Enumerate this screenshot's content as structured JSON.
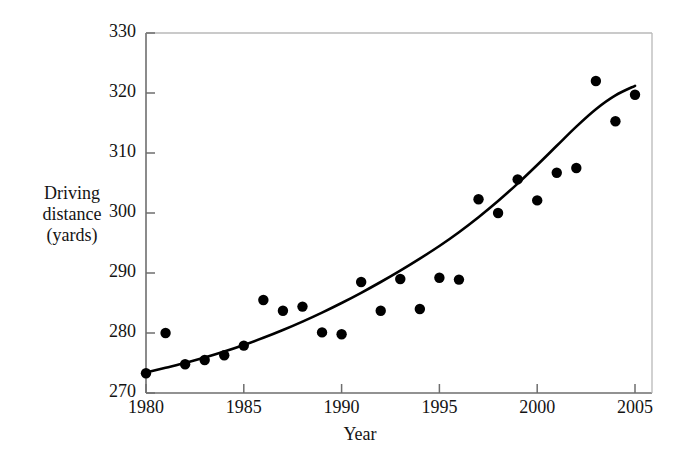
{
  "chart_data": {
    "type": "scatter",
    "title": "",
    "xlabel": "Year",
    "ylabel": "Driving distance (yards)",
    "ylabel_lines": [
      "Driving",
      "distance",
      "(yards)"
    ],
    "xlim": [
      1980,
      2005
    ],
    "ylim": [
      270,
      330
    ],
    "xticks": [
      1980,
      1985,
      1990,
      1995,
      2000,
      2005
    ],
    "xtick_labels": [
      "1980",
      "1985",
      "1990",
      "1995",
      "2000",
      "2005"
    ],
    "yticks": [
      270,
      280,
      290,
      300,
      310,
      320,
      330
    ],
    "ytick_labels": [
      "270",
      "280",
      "290",
      "300",
      "310",
      "320",
      "330"
    ],
    "grid": false,
    "legend": null,
    "marker": "filled-circle",
    "marker_color": "#000000",
    "line_color": "#000000",
    "x": [
      1980,
      1981,
      1982,
      1983,
      1984,
      1985,
      1986,
      1987,
      1988,
      1989,
      1990,
      1991,
      1992,
      1993,
      1994,
      1995,
      1996,
      1997,
      1998,
      1999,
      2000,
      2001,
      2002,
      2003,
      2004,
      2005
    ],
    "values": [
      273.3,
      280.0,
      274.8,
      275.5,
      276.3,
      277.9,
      285.5,
      283.7,
      284.4,
      280.1,
      279.8,
      288.5,
      283.7,
      289.0,
      284.0,
      289.2,
      288.9,
      302.3,
      300.0,
      305.6,
      302.1,
      306.7,
      307.5,
      322.0,
      315.3,
      319.7
    ],
    "fit_curve": {
      "name": "smooth trend curve",
      "x": [
        1980,
        1981,
        1982,
        1983,
        1984,
        1985,
        1986,
        1987,
        1988,
        1989,
        1990,
        1991,
        1992,
        1993,
        1994,
        1995,
        1996,
        1997,
        1998,
        1999,
        2000,
        2001,
        2002,
        2003,
        2004,
        2005
      ],
      "y": [
        273.4,
        274.2,
        275.0,
        275.9,
        276.9,
        278.0,
        279.2,
        280.5,
        281.9,
        283.4,
        285.0,
        286.7,
        288.5,
        290.4,
        292.4,
        294.5,
        296.8,
        299.3,
        302.0,
        304.9,
        308.0,
        311.2,
        314.4,
        317.3,
        319.6,
        321.2
      ]
    }
  },
  "axes": {
    "ylabel_text": "Driving\ndistance\n(yards)",
    "xlabel_text": "Year"
  }
}
